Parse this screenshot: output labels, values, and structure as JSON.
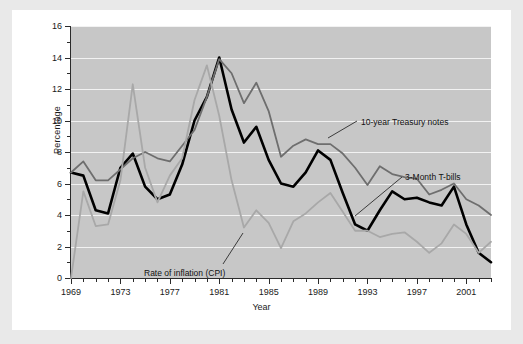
{
  "chart_data": {
    "type": "line",
    "title": "",
    "xlabel": "Year",
    "ylabel": "Percentage",
    "xlim": [
      1969,
      2003
    ],
    "ylim": [
      0,
      16
    ],
    "grid": true,
    "legend_position": "inline-annotations",
    "x": [
      1969,
      1970,
      1971,
      1972,
      1973,
      1974,
      1975,
      1976,
      1977,
      1978,
      1979,
      1980,
      1981,
      1982,
      1983,
      1984,
      1985,
      1986,
      1987,
      1988,
      1989,
      1990,
      1991,
      1992,
      1993,
      1994,
      1995,
      1996,
      1997,
      1998,
      1999,
      2000,
      2001,
      2002,
      2003
    ],
    "y_ticks": [
      0,
      2,
      4,
      6,
      8,
      10,
      12,
      14,
      16
    ],
    "x_ticks_major": [
      1969,
      1973,
      1977,
      1981,
      1985,
      1989,
      1993,
      1997,
      2001
    ],
    "series": [
      {
        "name": "3-Month T-bills",
        "color": "#000000",
        "width": 2.6,
        "values": [
          6.7,
          6.5,
          4.3,
          4.1,
          7.0,
          7.9,
          5.8,
          5.0,
          5.3,
          7.2,
          10.0,
          11.5,
          14.0,
          10.7,
          8.6,
          9.6,
          7.5,
          6.0,
          5.8,
          6.7,
          8.1,
          7.5,
          5.4,
          3.4,
          3.0,
          4.3,
          5.5,
          5.0,
          5.1,
          4.8,
          4.6,
          5.8,
          3.4,
          1.6,
          1.0
        ]
      },
      {
        "name": "10-year Treasury notes",
        "color": "#6e6e6e",
        "width": 1.8,
        "values": [
          6.7,
          7.4,
          6.2,
          6.2,
          6.9,
          7.6,
          8.0,
          7.6,
          7.4,
          8.4,
          9.4,
          11.5,
          13.9,
          13.0,
          11.1,
          12.4,
          10.6,
          7.7,
          8.4,
          8.8,
          8.5,
          8.5,
          7.9,
          7.0,
          5.9,
          7.1,
          6.6,
          6.4,
          6.3,
          5.3,
          5.6,
          6.0,
          5.0,
          4.6,
          4.0
        ]
      },
      {
        "name": "Rate of inflation (CPI)",
        "color": "#a8a8a8",
        "width": 1.8,
        "values": [
          0.0,
          5.5,
          3.3,
          3.4,
          6.2,
          12.3,
          7.0,
          4.8,
          6.5,
          7.6,
          11.3,
          13.5,
          10.3,
          6.2,
          3.2,
          4.3,
          3.5,
          1.9,
          3.6,
          4.1,
          4.8,
          5.4,
          4.2,
          3.0,
          3.0,
          2.6,
          2.8,
          2.9,
          2.3,
          1.6,
          2.2,
          3.4,
          2.8,
          1.6,
          2.3
        ]
      }
    ],
    "annotations": [
      {
        "text": "10-year Treasury notes",
        "label_x": 336,
        "label_y": 97
      },
      {
        "text": "3-Month T-bills",
        "label_x": 380,
        "label_y": 152
      },
      {
        "text": "Rate of inflation (CPI)",
        "label_x": 119,
        "label_y": 248
      }
    ]
  }
}
